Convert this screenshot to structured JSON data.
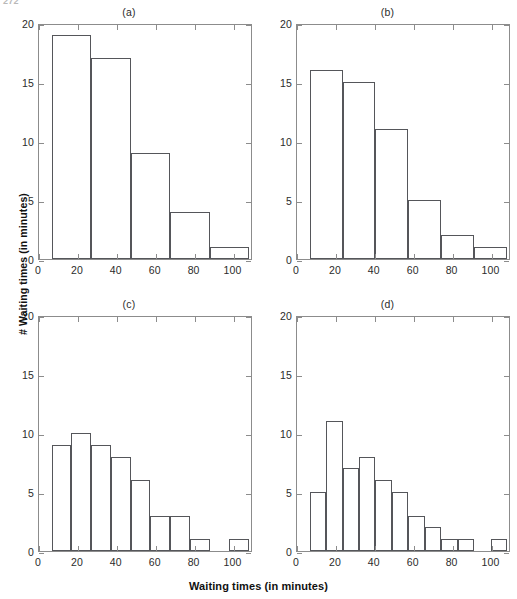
{
  "page_number": "272",
  "axis_titles": {
    "x": "Waiting times (in minutes)",
    "y": "# Waiting times (in minutes)"
  },
  "chart_data": [
    {
      "type": "bar",
      "title": "(a)",
      "panel_id": "a",
      "xlabel": "Waiting times (in minutes)",
      "ylabel": "# Waiting times (in minutes)",
      "xlim": [
        0,
        110
      ],
      "ylim": [
        0,
        20
      ],
      "xticks": [
        0,
        20,
        40,
        60,
        80,
        100
      ],
      "yticks": [
        0,
        5,
        10,
        15,
        20
      ],
      "xticklabels": [
        "0",
        "20",
        "40",
        "60",
        "80",
        "100"
      ],
      "yticklabels": [
        "0",
        "5",
        "10",
        "15",
        "20"
      ],
      "grid": false,
      "legend": null,
      "bin_edges": [
        6.5,
        26.8,
        47.1,
        67.4,
        87.7,
        108.0
      ],
      "bin_width": 20.3,
      "values": [
        19,
        17,
        9,
        4,
        1
      ]
    },
    {
      "type": "bar",
      "title": "(b)",
      "panel_id": "b",
      "xlabel": "Waiting times (in minutes)",
      "ylabel": "# Waiting times (in minutes)",
      "xlim": [
        0,
        110
      ],
      "ylim": [
        0,
        20
      ],
      "xticks": [
        0,
        20,
        40,
        60,
        80,
        100
      ],
      "yticks": [
        0,
        5,
        10,
        15,
        20
      ],
      "xticklabels": [
        "0",
        "20",
        "40",
        "60",
        "80",
        "100"
      ],
      "yticklabels": [
        "0",
        "5",
        "10",
        "15",
        "20"
      ],
      "grid": false,
      "legend": null,
      "bin_edges": [
        6.5,
        23.4,
        40.3,
        57.2,
        74.1,
        91.0,
        107.9
      ],
      "bin_width": 16.9,
      "values": [
        16,
        15,
        11,
        5,
        2,
        1
      ]
    },
    {
      "type": "bar",
      "title": "(c)",
      "panel_id": "c",
      "xlabel": "Waiting times (in minutes)",
      "ylabel": "# Waiting times (in minutes)",
      "xlim": [
        0,
        110
      ],
      "ylim": [
        0,
        20
      ],
      "xticks": [
        0,
        20,
        40,
        60,
        80,
        100
      ],
      "yticks": [
        0,
        5,
        10,
        15,
        20
      ],
      "xticklabels": [
        "0",
        "20",
        "40",
        "60",
        "80",
        "100"
      ],
      "yticklabels": [
        "0",
        "5",
        "10",
        "15",
        "20"
      ],
      "grid": false,
      "legend": null,
      "bin_edges": [
        6.5,
        16.65,
        26.8,
        36.95,
        47.1,
        57.25,
        67.4,
        77.55,
        87.7,
        97.85,
        108.0
      ],
      "bin_width": 10.15,
      "values": [
        9,
        10,
        9,
        8,
        6,
        3,
        3,
        1,
        0,
        1
      ]
    },
    {
      "type": "bar",
      "title": "(d)",
      "panel_id": "d",
      "xlabel": "Waiting times (in minutes)",
      "ylabel": "# Waiting times (in minutes)",
      "xlim": [
        0,
        110
      ],
      "ylim": [
        0,
        20
      ],
      "xticks": [
        0,
        20,
        40,
        60,
        80,
        100
      ],
      "yticks": [
        0,
        5,
        10,
        15,
        20
      ],
      "xticklabels": [
        "0",
        "20",
        "40",
        "60",
        "80",
        "100"
      ],
      "yticklabels": [
        "0",
        "5",
        "10",
        "15",
        "20"
      ],
      "grid": false,
      "legend": null,
      "bin_edges": [
        6.5,
        14.96,
        23.42,
        31.88,
        40.34,
        48.8,
        57.26,
        65.72,
        74.18,
        82.64,
        91.1,
        99.56,
        108.02
      ],
      "bin_width": 8.46,
      "values": [
        5,
        11,
        7,
        8,
        6,
        5,
        3,
        2,
        1,
        1,
        0,
        1
      ]
    }
  ]
}
